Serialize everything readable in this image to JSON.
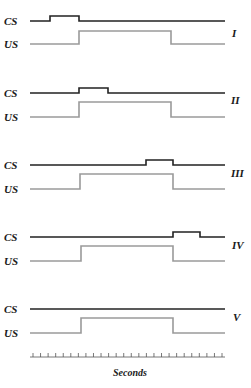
{
  "diagram": {
    "type": "timing-diagram",
    "signal_labels": {
      "cs": "CS",
      "us": "US"
    },
    "colors": {
      "cs": "#222222",
      "us": "#9a9a9a"
    },
    "x_axis": {
      "label": "Seconds",
      "tick_count": 26
    },
    "panels": [
      {
        "id": "I",
        "label": "I",
        "cs_pulse": [
          50,
          79
        ],
        "us_pulse": [
          79,
          171
        ]
      },
      {
        "id": "II",
        "label": "II",
        "cs_pulse": [
          79,
          108
        ],
        "us_pulse": [
          79,
          171
        ]
      },
      {
        "id": "III",
        "label": "III",
        "cs_pulse": [
          146,
          173
        ],
        "us_pulse": [
          79,
          171
        ]
      },
      {
        "id": "IV",
        "label": "IV",
        "cs_pulse": [
          173,
          200
        ],
        "us_pulse": [
          79,
          171
        ]
      },
      {
        "id": "V",
        "label": "V",
        "cs_pulse": null,
        "us_pulse": [
          79,
          171
        ]
      }
    ]
  }
}
